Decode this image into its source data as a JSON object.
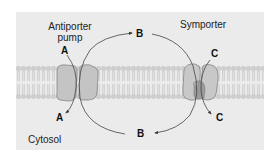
{
  "diagram": {
    "labels": {
      "antiporter_line1": "Antiporter",
      "antiporter_line2": "pump",
      "symporter": "Symporter",
      "cytosol": "Cytosol"
    },
    "molecules": {
      "a_top": "A",
      "a_bottom": "A",
      "b_top": "B",
      "b_bottom": "B",
      "c_top": "C",
      "c_bottom": "C"
    },
    "colors": {
      "panel": "#ebebeb",
      "lipid_head": "#c8c8c8",
      "lipid_tail": "#d6d6d6",
      "protein": "#c4c4c4",
      "protein_outline": "#7a7a7a",
      "symporter_core": "#9a9a9a",
      "arrow": "#555555"
    }
  }
}
